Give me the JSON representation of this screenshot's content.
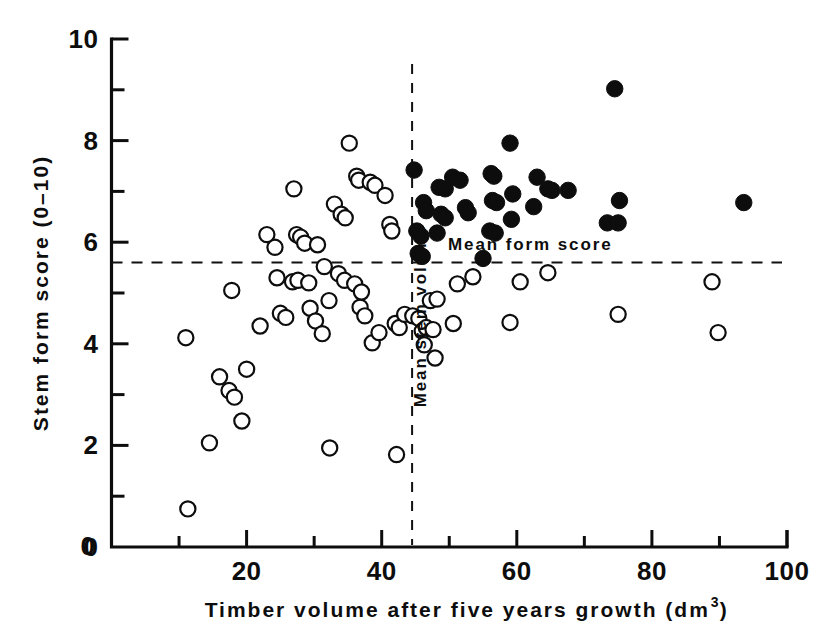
{
  "chart_data": {
    "type": "scatter",
    "title": "",
    "xlabel": "Timber volume after five years growth (dm3)",
    "xlabel_main": "Timber volume after five years growth (dm",
    "xlabel_sup": "3",
    "xlabel_tail": ")",
    "ylabel": "Stem form score (0–10)",
    "xlim": [
      0,
      100
    ],
    "ylim": [
      0,
      10
    ],
    "grid": false,
    "legend_position": "none",
    "x_ticks_major": [
      0,
      20,
      40,
      60,
      80,
      100
    ],
    "x_ticks_major_labels": [
      "0",
      "20",
      "40",
      "60",
      "80",
      "100"
    ],
    "x_ticks_minor": [
      10,
      30,
      50,
      70,
      90
    ],
    "y_ticks_major": [
      0,
      2,
      4,
      6,
      8,
      10
    ],
    "y_ticks_major_labels": [
      "0",
      "2",
      "4",
      "6",
      "8",
      "10"
    ],
    "y_ticks_minor": [
      1,
      3,
      5,
      7,
      9
    ],
    "annotations": [
      {
        "name": "mean-form-score-label",
        "text": "Mean form score",
        "x": 62.0,
        "y": 5.85,
        "orientation": "horizontal"
      },
      {
        "name": "mean-stem-volume-label",
        "text": "Mean stem volume",
        "x": 46.6,
        "y": 2.75,
        "orientation": "vertical"
      }
    ],
    "reference_lines": [
      {
        "name": "mean-form-score-line",
        "orientation": "horizontal",
        "value": 5.6,
        "style": "dashed"
      },
      {
        "name": "mean-stem-volume-line",
        "orientation": "vertical",
        "value": 44.5,
        "style": "dashed"
      }
    ],
    "series": [
      {
        "name": "Unselected trees (open circles)",
        "marker": "open-circle",
        "color": "#ffffff",
        "edge_color": "#0d0d0d",
        "points": [
          [
            11.3,
            0.75
          ],
          [
            11.0,
            4.12
          ],
          [
            14.5,
            2.05
          ],
          [
            16.0,
            3.35
          ],
          [
            17.4,
            3.08
          ],
          [
            18.2,
            2.95
          ],
          [
            17.8,
            5.05
          ],
          [
            19.3,
            2.48
          ],
          [
            20.0,
            3.5
          ],
          [
            22.0,
            4.35
          ],
          [
            23.0,
            6.15
          ],
          [
            24.2,
            5.9
          ],
          [
            25.0,
            4.6
          ],
          [
            24.5,
            5.3
          ],
          [
            25.8,
            4.52
          ],
          [
            27.0,
            7.05
          ],
          [
            27.4,
            6.15
          ],
          [
            28.0,
            6.1
          ],
          [
            28.6,
            5.98
          ],
          [
            26.8,
            5.22
          ],
          [
            27.6,
            5.25
          ],
          [
            29.2,
            5.2
          ],
          [
            29.4,
            4.7
          ],
          [
            30.5,
            5.95
          ],
          [
            31.5,
            5.52
          ],
          [
            30.2,
            4.45
          ],
          [
            31.2,
            4.2
          ],
          [
            32.3,
            1.95
          ],
          [
            32.2,
            4.85
          ],
          [
            33.0,
            6.75
          ],
          [
            34.0,
            6.55
          ],
          [
            34.6,
            6.48
          ],
          [
            33.6,
            5.38
          ],
          [
            34.5,
            5.25
          ],
          [
            35.2,
            7.95
          ],
          [
            36.3,
            7.3
          ],
          [
            36.6,
            7.22
          ],
          [
            36.0,
            5.18
          ],
          [
            36.8,
            4.72
          ],
          [
            37.0,
            5.02
          ],
          [
            37.5,
            4.55
          ],
          [
            38.3,
            7.18
          ],
          [
            39.0,
            7.12
          ],
          [
            38.6,
            4.02
          ],
          [
            39.6,
            4.22
          ],
          [
            40.5,
            6.92
          ],
          [
            41.2,
            6.35
          ],
          [
            41.5,
            6.22
          ],
          [
            42.0,
            4.4
          ],
          [
            42.6,
            4.32
          ],
          [
            43.4,
            4.58
          ],
          [
            42.2,
            1.82
          ],
          [
            44.6,
            4.55
          ],
          [
            45.5,
            4.5
          ],
          [
            47.2,
            4.85
          ],
          [
            48.2,
            4.88
          ],
          [
            46.0,
            4.25
          ],
          [
            46.6,
            4.32
          ],
          [
            47.6,
            4.28
          ],
          [
            46.3,
            3.98
          ],
          [
            47.9,
            3.72
          ],
          [
            51.2,
            5.18
          ],
          [
            50.6,
            4.4
          ],
          [
            53.5,
            5.32
          ],
          [
            59.0,
            4.42
          ],
          [
            60.5,
            5.22
          ],
          [
            64.6,
            5.4
          ],
          [
            75.0,
            4.58
          ],
          [
            88.9,
            5.22
          ],
          [
            89.8,
            4.22
          ]
        ]
      },
      {
        "name": "Selected trees (filled circles)",
        "marker": "filled-circle",
        "color": "#0d0d0d",
        "edge_color": "#0d0d0d",
        "points": [
          [
            44.8,
            7.42
          ],
          [
            46.2,
            6.78
          ],
          [
            46.6,
            6.62
          ],
          [
            45.2,
            6.22
          ],
          [
            45.8,
            6.12
          ],
          [
            45.4,
            5.78
          ],
          [
            46.0,
            5.72
          ],
          [
            48.5,
            7.08
          ],
          [
            49.4,
            7.05
          ],
          [
            48.8,
            6.55
          ],
          [
            49.4,
            6.48
          ],
          [
            48.2,
            6.18
          ],
          [
            50.5,
            7.28
          ],
          [
            51.6,
            7.22
          ],
          [
            52.4,
            6.68
          ],
          [
            52.8,
            6.58
          ],
          [
            55.0,
            5.68
          ],
          [
            56.2,
            7.35
          ],
          [
            56.6,
            7.3
          ],
          [
            56.4,
            6.82
          ],
          [
            57.0,
            6.78
          ],
          [
            56.0,
            6.22
          ],
          [
            56.8,
            6.18
          ],
          [
            59.0,
            7.95
          ],
          [
            59.4,
            6.95
          ],
          [
            59.2,
            6.45
          ],
          [
            62.5,
            6.7
          ],
          [
            63.0,
            7.28
          ],
          [
            64.6,
            7.05
          ],
          [
            65.2,
            7.02
          ],
          [
            67.6,
            7.02
          ],
          [
            74.5,
            9.02
          ],
          [
            73.4,
            6.38
          ],
          [
            75.2,
            6.82
          ],
          [
            75.0,
            6.38
          ],
          [
            93.6,
            6.78
          ]
        ]
      }
    ]
  }
}
